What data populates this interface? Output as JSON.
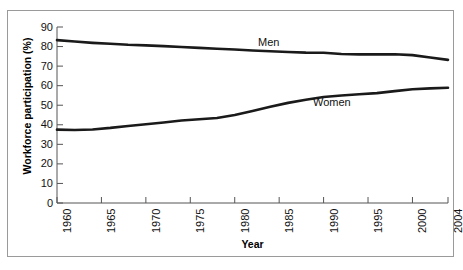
{
  "chart_data": {
    "type": "line",
    "title": "",
    "xlabel": "Year",
    "ylabel": "Workforce participation (%)",
    "xlim": [
      1960,
      2004
    ],
    "ylim": [
      0,
      90
    ],
    "grid": false,
    "legend_position": "inline-on-series",
    "x_tick_labels": [
      "1960",
      "1965",
      "1970",
      "1975",
      "1980",
      "1985",
      "1990",
      "1995",
      "2000",
      "2004"
    ],
    "x_tick_values": [
      1960,
      1965,
      1970,
      1975,
      1980,
      1985,
      1990,
      1995,
      2000,
      2004
    ],
    "y_tick_labels": [
      "0",
      "10",
      "20",
      "30",
      "40",
      "50",
      "60",
      "70",
      "80",
      "90"
    ],
    "y_tick_values": [
      0,
      10,
      20,
      30,
      40,
      50,
      60,
      70,
      80,
      90
    ],
    "x": [
      1960,
      1962,
      1964,
      1966,
      1968,
      1970,
      1972,
      1974,
      1976,
      1978,
      1980,
      1982,
      1984,
      1986,
      1988,
      1990,
      1992,
      1994,
      1996,
      1998,
      2000,
      2002,
      2004
    ],
    "series": [
      {
        "name": "Men",
        "label": "Men",
        "color": "#1a1a1a",
        "values": [
          83.3,
          82.6,
          81.9,
          81.4,
          80.9,
          80.6,
          80.2,
          79.8,
          79.3,
          78.9,
          78.5,
          78.0,
          77.6,
          77.2,
          76.9,
          76.8,
          76.2,
          76.0,
          76.0,
          76.1,
          75.6,
          74.4,
          73.2
        ]
      },
      {
        "name": "Women",
        "label": "Women",
        "color": "#1a1a1a",
        "values": [
          37.5,
          37.3,
          37.6,
          38.4,
          39.4,
          40.3,
          41.2,
          42.2,
          42.8,
          43.5,
          45.0,
          47.0,
          49.2,
          51.2,
          52.8,
          54.2,
          55.0,
          55.6,
          56.2,
          57.2,
          58.2,
          58.6,
          58.9
        ]
      }
    ]
  }
}
